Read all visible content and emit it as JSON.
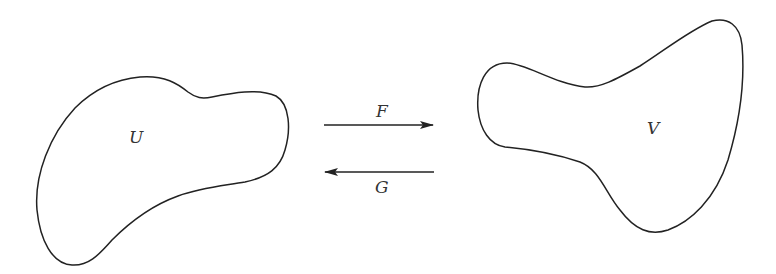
{
  "diagram": {
    "sets": [
      {
        "id": "U",
        "label": "U"
      },
      {
        "id": "V",
        "label": "V"
      }
    ],
    "maps": [
      {
        "label": "F",
        "from": "U",
        "to": "V"
      },
      {
        "label": "G",
        "from": "V",
        "to": "U"
      }
    ],
    "colors": {
      "stroke": "#222222",
      "background": "#ffffff"
    }
  }
}
